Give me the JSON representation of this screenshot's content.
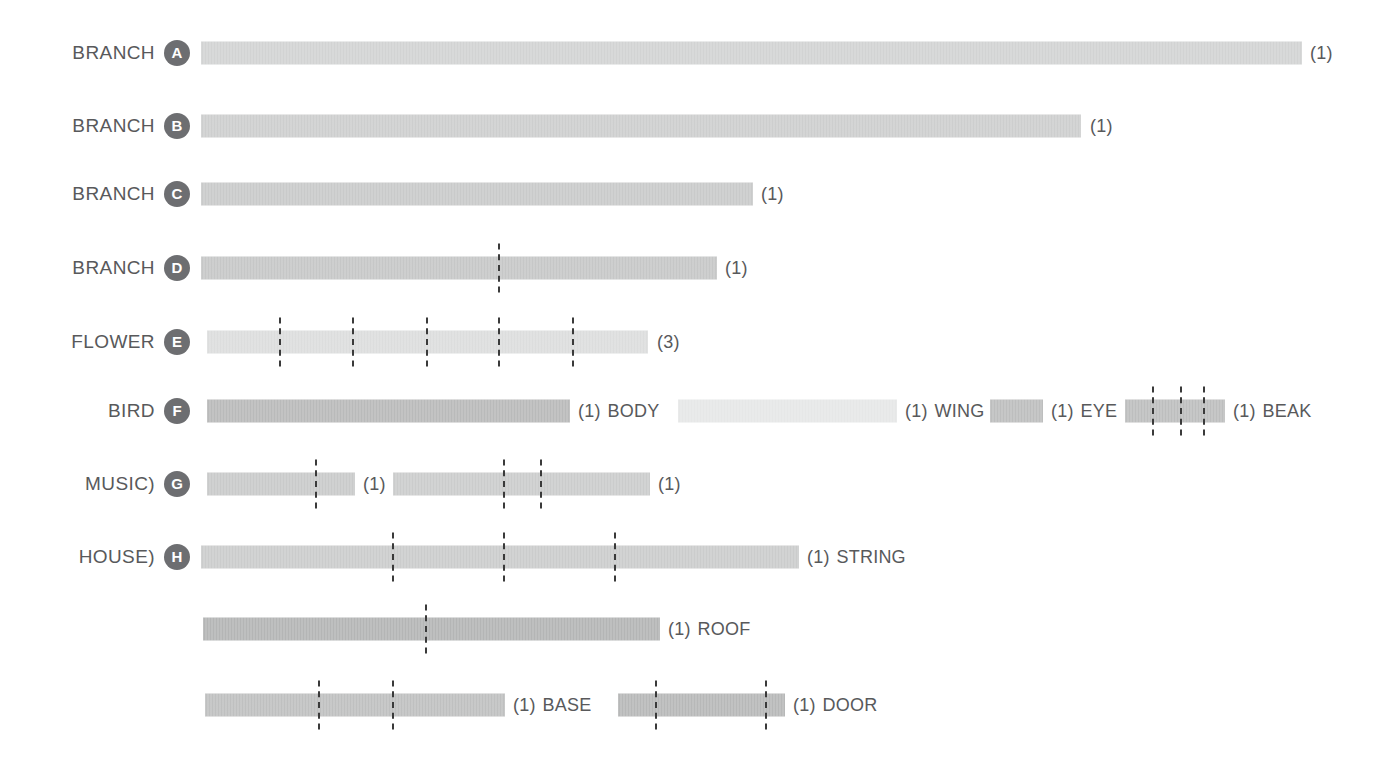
{
  "meta": {
    "palette": {
      "text": "#58595b",
      "badge_bg": "#6d6e71",
      "badge_fg": "#ffffff",
      "dash": "#3a3a3a",
      "bar_light": "#d3d4d4",
      "bar_lighter": "#e3e4e4",
      "bar_mid": "#c2c3c3",
      "bar_dark": "#b4b5b5"
    }
  },
  "chart_data": {
    "type": "bar",
    "title": "",
    "xlabel": "",
    "ylabel": "",
    "grid": false,
    "legend": "none",
    "orientation": "horizontal",
    "categories": [
      "BRANCH A",
      "BRANCH B",
      "BRANCH C",
      "BRANCH D",
      "FLOWER E",
      "BIRD F",
      "MUSIC) G",
      "HOUSE) H",
      "ROOF",
      "BASE / DOOR"
    ],
    "values": [
      1100,
      881,
      553,
      517,
      441,
      363,
      148,
      600,
      457,
      300
    ],
    "rows": [
      {
        "label": "BRANCH",
        "badge": "A",
        "y": 53,
        "bars": [
          {
            "name": "branch-a",
            "x": 201,
            "width": 1101,
            "shade": "#d2d3d3",
            "count": "(1)",
            "count_x": 1310,
            "tail_label": "",
            "dashes": []
          }
        ]
      },
      {
        "label": "BRANCH",
        "badge": "B",
        "y": 126,
        "bars": [
          {
            "name": "branch-b",
            "x": 201,
            "width": 880,
            "shade": "#cdcece",
            "count": "(1)",
            "count_x": 1090,
            "tail_label": "",
            "dashes": []
          }
        ]
      },
      {
        "label": "BRANCH",
        "badge": "C",
        "y": 194,
        "bars": [
          {
            "name": "branch-c",
            "x": 201,
            "width": 552,
            "shade": "#c9caca",
            "count": "(1)",
            "count_x": 761,
            "tail_label": "",
            "dashes": []
          }
        ]
      },
      {
        "label": "BRANCH",
        "badge": "D",
        "y": 268,
        "bars": [
          {
            "name": "branch-d",
            "x": 201,
            "width": 516,
            "shade": "#c6c7c7",
            "count": "(1)",
            "count_x": 725,
            "tail_label": "",
            "dashes": [
              498
            ]
          }
        ]
      },
      {
        "label": "FLOWER",
        "badge": "E",
        "y": 342,
        "bars": [
          {
            "name": "flower-e",
            "x": 207,
            "width": 441,
            "shade": "#dcdddd",
            "count": "(3)",
            "count_x": 657,
            "tail_label": "",
            "dashes": [
              279,
              352,
              426,
              498,
              572
            ]
          }
        ]
      },
      {
        "label": "BIRD",
        "badge": "F",
        "y": 411,
        "bars": [
          {
            "name": "bird-body",
            "x": 207,
            "width": 363,
            "shade": "#b9baba",
            "count": "(1)",
            "count_x": 578,
            "tail_label": "BODY",
            "dashes": []
          },
          {
            "name": "bird-wing",
            "x": 678,
            "width": 219,
            "shade": "#e6e7e7",
            "count": "(1)",
            "count_x": 905,
            "tail_label": "WING",
            "dashes": []
          },
          {
            "name": "bird-eye",
            "x": 990,
            "width": 53,
            "shade": "#bdbebe",
            "count": "(1)",
            "count_x": 1051,
            "tail_label": "EYE",
            "dashes": []
          },
          {
            "name": "bird-beak",
            "x": 1125,
            "width": 100,
            "shade": "#bdbebe",
            "count": "(1)",
            "count_x": 1233,
            "tail_label": "BEAK",
            "dashes": [
              1152,
              1180,
              1203
            ]
          }
        ]
      },
      {
        "label": "MUSIC)",
        "badge": "G",
        "y": 484,
        "bars": [
          {
            "name": "music-g-1",
            "x": 207,
            "width": 148,
            "shade": "#c9caca",
            "count": "(1)",
            "count_x": 363,
            "tail_label": "",
            "dashes": [
              315
            ]
          },
          {
            "name": "music-g-2",
            "x": 393,
            "width": 257,
            "shade": "#cbcccc",
            "count": "(1)",
            "count_x": 658,
            "tail_label": "",
            "dashes": [
              503,
              540
            ]
          }
        ]
      },
      {
        "label": "HOUSE)",
        "badge": "H",
        "y": 557,
        "bars": [
          {
            "name": "house-string",
            "x": 201,
            "width": 598,
            "shade": "#cbcccc",
            "count": "(1)",
            "count_x": 807,
            "tail_label": "STRING",
            "dashes": [
              392,
              503,
              614
            ]
          }
        ]
      },
      {
        "label": "",
        "badge": "",
        "y": 629,
        "bars": [
          {
            "name": "house-roof",
            "x": 203,
            "width": 457,
            "shade": "#b4b5b5",
            "count": "(1)",
            "count_x": 668,
            "tail_label": "ROOF",
            "dashes": [
              425
            ]
          }
        ]
      },
      {
        "label": "",
        "badge": "",
        "y": 705,
        "bars": [
          {
            "name": "house-base",
            "x": 205,
            "width": 300,
            "shade": "#bfc0c0",
            "count": "(1)",
            "count_x": 513,
            "tail_label": "BASE",
            "dashes": [
              318,
              392
            ]
          },
          {
            "name": "house-door",
            "x": 618,
            "width": 167,
            "shade": "#b7b8b8",
            "count": "(1)",
            "count_x": 793,
            "tail_label": "DOOR",
            "dashes": [
              655,
              765
            ]
          }
        ]
      }
    ]
  }
}
